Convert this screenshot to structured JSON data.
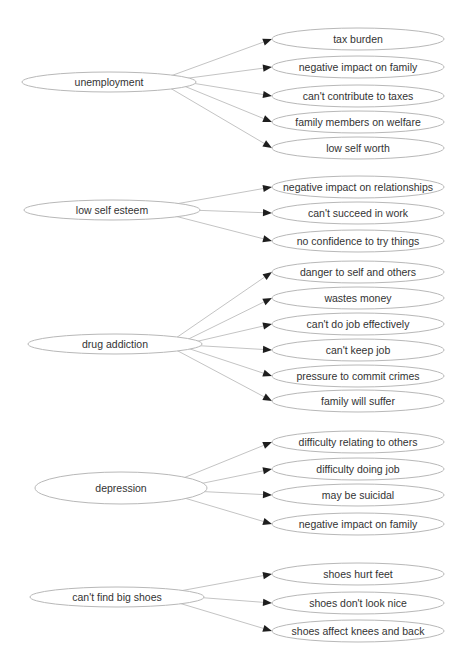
{
  "diagram": {
    "type": "cause-effect graph",
    "colors": {
      "background": "#ffffff",
      "node_stroke": "#b8b8b8",
      "edge_stroke": "#c4c4c4",
      "arrowhead": "#1e1e1e",
      "text": "#333333"
    },
    "groups": [
      {
        "source": {
          "label": "unemployment",
          "cx": 109,
          "cy": 82,
          "rx": 87,
          "ry": 10
        },
        "targets": [
          {
            "label": "tax burden",
            "cy": 39
          },
          {
            "label": "negative impact on family",
            "cy": 67
          },
          {
            "label": "can't contribute to taxes",
            "cy": 96
          },
          {
            "label": "family members on welfare",
            "cy": 122
          },
          {
            "label": "low self worth",
            "cy": 148
          }
        ]
      },
      {
        "source": {
          "label": "low self esteem",
          "cx": 112,
          "cy": 210,
          "rx": 88,
          "ry": 10
        },
        "targets": [
          {
            "label": "negative impact on relationships",
            "cy": 187
          },
          {
            "label": "can't succeed in work",
            "cy": 213
          },
          {
            "label": "no confidence to try things",
            "cy": 241
          }
        ]
      },
      {
        "source": {
          "label": "drug addiction",
          "cx": 115,
          "cy": 344,
          "rx": 87,
          "ry": 10
        },
        "targets": [
          {
            "label": "danger to self and others",
            "cy": 272
          },
          {
            "label": "wastes money",
            "cy": 298
          },
          {
            "label": "can't do job effectively",
            "cy": 324
          },
          {
            "label": "can't keep job",
            "cy": 350
          },
          {
            "label": "pressure to commit crimes",
            "cy": 376
          },
          {
            "label": "family will suffer",
            "cy": 401
          }
        ]
      },
      {
        "source": {
          "label": "depression",
          "cx": 121,
          "cy": 488,
          "rx": 86,
          "ry": 16
        },
        "targets": [
          {
            "label": "difficulty relating to others",
            "cy": 442
          },
          {
            "label": "difficulty doing job",
            "cy": 469
          },
          {
            "label": "may be suicidal",
            "cy": 495
          },
          {
            "label": "negative impact on family",
            "cy": 524
          }
        ]
      },
      {
        "source": {
          "label": "can't find big shoes",
          "cx": 117,
          "cy": 597,
          "rx": 87,
          "ry": 10
        },
        "targets": [
          {
            "label": "shoes hurt feet",
            "cy": 574
          },
          {
            "label": "shoes don't look nice",
            "cy": 603
          },
          {
            "label": "shoes affect knees and back",
            "cy": 631
          }
        ]
      }
    ],
    "target_layout": {
      "cx": 358,
      "rx": 86,
      "ry": 11
    }
  }
}
